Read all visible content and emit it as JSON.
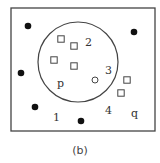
{
  "caption": "(b)",
  "colors": {
    "stroke": "#444444",
    "fill_dot": "#111111",
    "background": "#ffffff"
  },
  "diagram": {
    "frame": {
      "x": 11,
      "y": 8,
      "width": 144,
      "height": 123
    },
    "set_circle": {
      "cx": 78,
      "cy": 62,
      "r": 40
    },
    "filled_points": [
      {
        "x": 28,
        "y": 26
      },
      {
        "x": 134,
        "y": 32
      },
      {
        "x": 21,
        "y": 73
      },
      {
        "x": 35,
        "y": 107
      },
      {
        "x": 81,
        "y": 121
      }
    ],
    "square_points": [
      {
        "x": 61,
        "y": 39
      },
      {
        "x": 74,
        "y": 46
      },
      {
        "x": 54,
        "y": 60
      },
      {
        "x": 74,
        "y": 66
      },
      {
        "x": 127,
        "y": 80
      },
      {
        "x": 121,
        "y": 93
      }
    ],
    "open_points": [
      {
        "x": 95,
        "y": 80
      }
    ],
    "labels": {
      "region_1": "1",
      "region_2": "2",
      "region_3": "3",
      "region_4": "4",
      "p": "p",
      "q": "q"
    }
  }
}
